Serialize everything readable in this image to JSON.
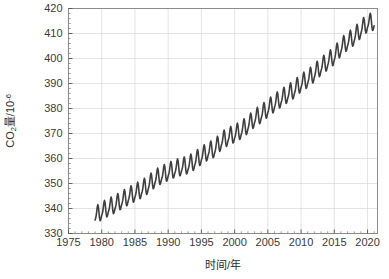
{
  "chart_data": {
    "type": "line",
    "title": "",
    "xlabel": "时间/年",
    "ylabel": "CO₂量/10⁻⁶",
    "ylabel_parts": {
      "base": "CO",
      "sub": "2",
      "mid": "量/10",
      "sup": "-6"
    },
    "xlim": [
      1975,
      2021.5
    ],
    "ylim": [
      330,
      420
    ],
    "xticks": [
      1975,
      1980,
      1985,
      1990,
      1995,
      2000,
      2005,
      2010,
      2015,
      2020
    ],
    "xtick_labels": [
      "1975",
      "1980",
      "1985",
      "1990",
      "1995",
      "2000",
      "2005",
      "2010",
      "2015",
      "2020"
    ],
    "yticks": [
      330,
      340,
      350,
      360,
      370,
      380,
      390,
      400,
      410,
      420
    ],
    "ytick_labels": [
      "330",
      "340",
      "350",
      "360",
      "370",
      "380",
      "390",
      "400",
      "410",
      "420"
    ],
    "x_minor_interval": 1,
    "y_minor_interval": 2,
    "grid": true,
    "grid_color": "#d9d9d9",
    "legend": "none",
    "line_color": "#3f3f3f",
    "line_width": 1.6,
    "series": [
      {
        "name": "CO₂ concentration (monthly mean)",
        "description": "Keeling curve: monthly mean atmospheric CO2 in parts per million with seasonal oscillation superimposed on rising trend",
        "x": [
          1979.0,
          1979.083,
          1979.167,
          1979.25,
          1979.333,
          1979.417,
          1979.5,
          1979.583,
          1979.667,
          1979.75,
          1979.833,
          1979.917,
          1980.0,
          1980.083,
          1980.167,
          1980.25,
          1980.333,
          1980.417,
          1980.5,
          1980.583,
          1980.667,
          1980.75,
          1980.833,
          1980.917,
          1981.0,
          1981.083,
          1981.167,
          1981.25,
          1981.333,
          1981.417,
          1981.5,
          1981.583,
          1981.667,
          1981.75,
          1981.833,
          1981.917,
          1982.0,
          1982.083,
          1982.167,
          1982.25,
          1982.333,
          1982.417,
          1982.5,
          1982.583,
          1982.667,
          1982.75,
          1982.833,
          1982.917,
          1983.0,
          1983.083,
          1983.167,
          1983.25,
          1983.333,
          1983.417,
          1983.5,
          1983.583,
          1983.667,
          1983.75,
          1983.833,
          1983.917,
          1984.0,
          1984.083,
          1984.167,
          1984.25,
          1984.333,
          1984.417,
          1984.5,
          1984.583,
          1984.667,
          1984.75,
          1984.833,
          1984.917,
          1985.0,
          1985.083,
          1985.167,
          1985.25,
          1985.333,
          1985.417,
          1985.5,
          1985.583,
          1985.667,
          1985.75,
          1985.833,
          1985.917,
          1986.0,
          1986.083,
          1986.167,
          1986.25,
          1986.333,
          1986.417,
          1986.5,
          1986.583,
          1986.667,
          1986.75,
          1986.833,
          1986.917,
          1987.0,
          1987.083,
          1987.167,
          1987.25,
          1987.333,
          1987.417,
          1987.5,
          1987.583,
          1987.667,
          1987.75,
          1987.833,
          1987.917,
          1988.0,
          1988.083,
          1988.167,
          1988.25,
          1988.333,
          1988.417,
          1988.5,
          1988.583,
          1988.667,
          1988.75,
          1988.833,
          1988.917,
          1989.0,
          1989.083,
          1989.167,
          1989.25,
          1989.333,
          1989.417,
          1989.5,
          1989.583,
          1989.667,
          1989.75,
          1989.833,
          1989.917,
          1990.0,
          1990.083,
          1990.167,
          1990.25,
          1990.333,
          1990.417,
          1990.5,
          1990.583,
          1990.667,
          1990.75,
          1990.833,
          1990.917,
          1991.0,
          1991.083,
          1991.167,
          1991.25,
          1991.333,
          1991.417,
          1991.5,
          1991.583,
          1991.667,
          1991.75,
          1991.833,
          1991.917,
          1992.0,
          1992.083,
          1992.167,
          1992.25,
          1992.333,
          1992.417,
          1992.5,
          1992.583,
          1992.667,
          1992.75,
          1992.833,
          1992.917,
          1993.0,
          1993.083,
          1993.167,
          1993.25,
          1993.333,
          1993.417,
          1993.5,
          1993.583,
          1993.667,
          1993.75,
          1993.833,
          1993.917,
          1994.0,
          1994.083,
          1994.167,
          1994.25,
          1994.333,
          1994.417,
          1994.5,
          1994.583,
          1994.667,
          1994.75,
          1994.833,
          1994.917,
          1995.0,
          1995.083,
          1995.167,
          1995.25,
          1995.333,
          1995.417,
          1995.5,
          1995.583,
          1995.667,
          1995.75,
          1995.833,
          1995.917,
          1996.0,
          1996.083,
          1996.167,
          1996.25,
          1996.333,
          1996.417,
          1996.5,
          1996.583,
          1996.667,
          1996.75,
          1996.833,
          1996.917,
          1997.0,
          1997.083,
          1997.167,
          1997.25,
          1997.333,
          1997.417,
          1997.5,
          1997.583,
          1997.667,
          1997.75,
          1997.833,
          1997.917,
          1998.0,
          1998.083,
          1998.167,
          1998.25,
          1998.333,
          1998.417,
          1998.5,
          1998.583,
          1998.667,
          1998.75,
          1998.833,
          1998.917,
          1999.0,
          1999.083,
          1999.167,
          1999.25,
          1999.333,
          1999.417,
          1999.5,
          1999.583,
          1999.667,
          1999.75,
          1999.833,
          1999.917,
          2000.0,
          2000.083,
          2000.167,
          2000.25,
          2000.333,
          2000.417,
          2000.5,
          2000.583,
          2000.667,
          2000.75,
          2000.833,
          2000.917,
          2001.0,
          2001.083,
          2001.167,
          2001.25,
          2001.333,
          2001.417,
          2001.5,
          2001.583,
          2001.667,
          2001.75,
          2001.833,
          2001.917,
          2002.0,
          2002.083,
          2002.167,
          2002.25,
          2002.333,
          2002.417,
          2002.5,
          2002.583,
          2002.667,
          2002.75,
          2002.833,
          2002.917,
          2003.0,
          2003.083,
          2003.167,
          2003.25,
          2003.333,
          2003.417,
          2003.5,
          2003.583,
          2003.667,
          2003.75,
          2003.833,
          2003.917,
          2004.0,
          2004.083,
          2004.167,
          2004.25,
          2004.333,
          2004.417,
          2004.5,
          2004.583,
          2004.667,
          2004.75,
          2004.833,
          2004.917,
          2005.0,
          2005.083,
          2005.167,
          2005.25,
          2005.333,
          2005.417,
          2005.5,
          2005.583,
          2005.667,
          2005.75,
          2005.833,
          2005.917,
          2006.0,
          2006.083,
          2006.167,
          2006.25,
          2006.333,
          2006.417,
          2006.5,
          2006.583,
          2006.667,
          2006.75,
          2006.833,
          2006.917,
          2007.0,
          2007.083,
          2007.167,
          2007.25,
          2007.333,
          2007.417,
          2007.5,
          2007.583,
          2007.667,
          2007.75,
          2007.833,
          2007.917,
          2008.0,
          2008.083,
          2008.167,
          2008.25,
          2008.333,
          2008.417,
          2008.5,
          2008.583,
          2008.667,
          2008.75,
          2008.833,
          2008.917,
          2009.0,
          2009.083,
          2009.167,
          2009.25,
          2009.333,
          2009.417,
          2009.5,
          2009.583,
          2009.667,
          2009.75,
          2009.833,
          2009.917,
          2010.0,
          2010.083,
          2010.167,
          2010.25,
          2010.333,
          2010.417,
          2010.5,
          2010.583,
          2010.667,
          2010.75,
          2010.833,
          2010.917,
          2011.0,
          2011.083,
          2011.167,
          2011.25,
          2011.333,
          2011.417,
          2011.5,
          2011.583,
          2011.667,
          2011.75,
          2011.833,
          2011.917,
          2012.0,
          2012.083,
          2012.167,
          2012.25,
          2012.333,
          2012.417,
          2012.5,
          2012.583,
          2012.667,
          2012.75,
          2012.833,
          2012.917,
          2013.0,
          2013.083,
          2013.167,
          2013.25,
          2013.333,
          2013.417,
          2013.5,
          2013.583,
          2013.667,
          2013.75,
          2013.833,
          2013.917,
          2014.0,
          2014.083,
          2014.167,
          2014.25,
          2014.333,
          2014.417,
          2014.5,
          2014.583,
          2014.667,
          2014.75,
          2014.833,
          2014.917,
          2015.0,
          2015.083,
          2015.167,
          2015.25,
          2015.333,
          2015.417,
          2015.5,
          2015.583,
          2015.667,
          2015.75,
          2015.833,
          2015.917,
          2016.0,
          2016.083,
          2016.167,
          2016.25,
          2016.333,
          2016.417,
          2016.5,
          2016.583,
          2016.667,
          2016.75,
          2016.833,
          2016.917,
          2017.0,
          2017.083,
          2017.167,
          2017.25,
          2017.333,
          2017.417,
          2017.5,
          2017.583,
          2017.667,
          2017.75,
          2017.833,
          2017.917,
          2018.0,
          2018.083,
          2018.167,
          2018.25,
          2018.333,
          2018.417,
          2018.5,
          2018.583,
          2018.667,
          2018.75,
          2018.833,
          2018.917,
          2019.0,
          2019.083,
          2019.167,
          2019.25,
          2019.333,
          2019.417,
          2019.5,
          2019.583,
          2019.667,
          2019.75,
          2019.833,
          2019.917,
          2020.0,
          2020.083,
          2020.167,
          2020.25,
          2020.333,
          2020.417,
          2020.5,
          2020.583,
          2020.667,
          2020.75,
          2020.833,
          2020.917,
          2021.0
        ],
        "annual_means": [
          {
            "year": 1979,
            "value": 336.8
          },
          {
            "year": 1980,
            "value": 338.7
          },
          {
            "year": 1981,
            "value": 340.1
          },
          {
            "year": 1982,
            "value": 341.4
          },
          {
            "year": 1983,
            "value": 343.0
          },
          {
            "year": 1984,
            "value": 344.6
          },
          {
            "year": 1985,
            "value": 346.0
          },
          {
            "year": 1986,
            "value": 347.4
          },
          {
            "year": 1987,
            "value": 349.2
          },
          {
            "year": 1988,
            "value": 351.6
          },
          {
            "year": 1989,
            "value": 353.1
          },
          {
            "year": 1990,
            "value": 354.4
          },
          {
            "year": 1991,
            "value": 355.6
          },
          {
            "year": 1992,
            "value": 356.4
          },
          {
            "year": 1993,
            "value": 357.1
          },
          {
            "year": 1994,
            "value": 358.8
          },
          {
            "year": 1995,
            "value": 360.8
          },
          {
            "year": 1996,
            "value": 362.6
          },
          {
            "year": 1997,
            "value": 363.7
          },
          {
            "year": 1998,
            "value": 366.7
          },
          {
            "year": 1999,
            "value": 368.4
          },
          {
            "year": 2000,
            "value": 369.6
          },
          {
            "year": 2001,
            "value": 371.1
          },
          {
            "year": 2002,
            "value": 373.2
          },
          {
            "year": 2003,
            "value": 375.8
          },
          {
            "year": 2004,
            "value": 377.5
          },
          {
            "year": 2005,
            "value": 379.8
          },
          {
            "year": 2006,
            "value": 381.9
          },
          {
            "year": 2007,
            "value": 383.8
          },
          {
            "year": 2008,
            "value": 385.6
          },
          {
            "year": 2009,
            "value": 387.4
          },
          {
            "year": 2010,
            "value": 389.9
          },
          {
            "year": 2011,
            "value": 391.6
          },
          {
            "year": 2012,
            "value": 393.9
          },
          {
            "year": 2013,
            "value": 396.5
          },
          {
            "year": 2014,
            "value": 398.6
          },
          {
            "year": 2015,
            "value": 400.8
          },
          {
            "year": 2016,
            "value": 404.2
          },
          {
            "year": 2017,
            "value": 406.6
          },
          {
            "year": 2018,
            "value": 408.5
          },
          {
            "year": 2019,
            "value": 411.4
          },
          {
            "year": 2020,
            "value": 413.9
          },
          {
            "year": 2021,
            "value": 414.5
          }
        ],
        "seasonal_amplitude": 3.2,
        "seasonal_peak_month_fraction": 0.37,
        "y_start": 336.8,
        "y_end": 414.5
      }
    ]
  }
}
